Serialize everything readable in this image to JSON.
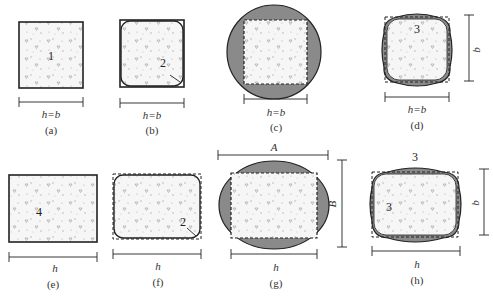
{
  "figure": {
    "panels": [
      {
        "id": "a",
        "caption": "(a)",
        "dim_label": "h=b",
        "section_number": "1",
        "shape": "square column section"
      },
      {
        "id": "b",
        "caption": "(b)",
        "dim_label": "h=b",
        "section_number": "2",
        "shape": "square section with rounded corners"
      },
      {
        "id": "c",
        "caption": "(c)",
        "dim_label": "h=b",
        "shape": "square section with circular jacket"
      },
      {
        "id": "d",
        "caption": "(d)",
        "dim_label": "h=b",
        "side_label": "b",
        "section_number": "3",
        "shape": "square section with curved-side jacket"
      },
      {
        "id": "e",
        "caption": "(e)",
        "dim_label": "h",
        "section_number": "4",
        "shape": "rectangular section"
      },
      {
        "id": "f",
        "caption": "(f)",
        "dim_label": "h",
        "section_number": "2",
        "shape": "rectangular section with rounded corners"
      },
      {
        "id": "g",
        "caption": "(g)",
        "dim_label": "h",
        "top_label": "A",
        "side_label": "B",
        "shape": "rectangular section with elliptical jacket"
      },
      {
        "id": "h",
        "caption": "(h)",
        "dim_label": "h",
        "side_label": "b",
        "top_number": "3",
        "side_number": "3",
        "shape": "rectangular section with curved-side jacket"
      }
    ],
    "colors": {
      "stroke": "#222222",
      "fill_shaded": "#8a8a8a",
      "concrete": "#f4f4f4"
    }
  }
}
